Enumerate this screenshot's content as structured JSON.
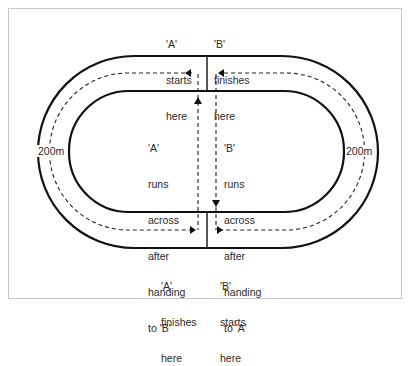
{
  "diagram": {
    "track": {
      "outer_stroke": "#111111",
      "inner_stroke": "#111111",
      "path_color": "#222222"
    },
    "labels": {
      "a_start": [
        "'A'",
        "starts",
        "here"
      ],
      "b_finish": [
        "'B'",
        "finishes",
        "here"
      ],
      "a_across": [
        "'A'",
        "runs",
        "across",
        "after",
        "handing",
        "to 'B'"
      ],
      "b_across": [
        "'B'",
        "runs",
        "across",
        "after",
        "handing",
        "to 'A'"
      ],
      "a_finish": [
        "'A'",
        "finishes",
        "here"
      ],
      "b_start": [
        "'B'",
        "starts",
        "here"
      ],
      "left_distance": "200m",
      "right_distance": "200m"
    }
  }
}
